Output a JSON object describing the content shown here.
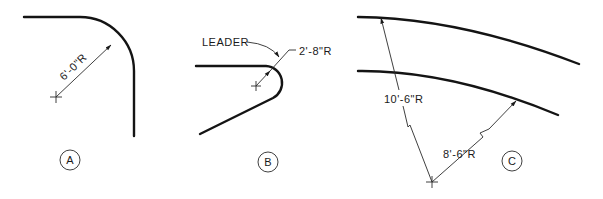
{
  "figures": [
    {
      "id": "A",
      "tag": "A",
      "dimension": "6'-0\"R",
      "description": "Quarter-circle corner arc with radius dimension"
    },
    {
      "id": "B",
      "tag": "B",
      "dimension": "2'-8\"R",
      "leader_label": "LEADER",
      "description": "Small radius arc dimensioned using a leader"
    },
    {
      "id": "C",
      "tag": "C",
      "dimensions": [
        "10'-6\"R",
        "8'-6\"R"
      ],
      "description": "Large radii with false (foreshortened) center and jogged dimension lines"
    }
  ],
  "colors": {
    "line": "#141414",
    "background": "#ffffff"
  }
}
